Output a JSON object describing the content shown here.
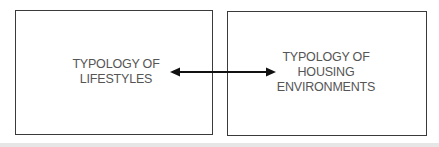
{
  "diagram": {
    "nodes": [
      {
        "id": "lifestyles",
        "label": "TYPOLOGY OF\nLIFESTYLES"
      },
      {
        "id": "housing",
        "label": "TYPOLOGY OF\nHOUSING\nENVIRONMENTS"
      }
    ],
    "edges": [
      {
        "from": "lifestyles",
        "to": "housing",
        "type": "bidirectional-arrow"
      }
    ],
    "colors": {
      "border": "#3a3a3a",
      "text": "#555555",
      "arrow": "#111111",
      "background": "#ffffff"
    }
  }
}
